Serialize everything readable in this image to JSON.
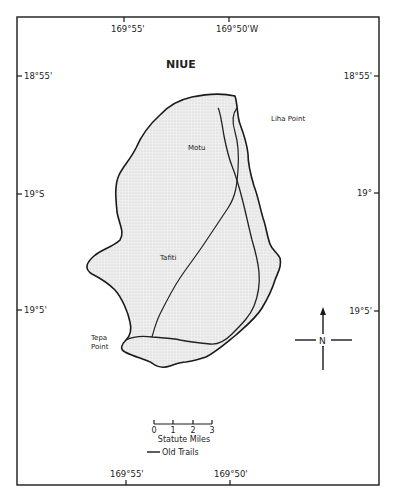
{
  "map": {
    "title": "NIUE",
    "longitude_labels_top": [
      "169°55'",
      "169°50'W"
    ],
    "longitude_labels_bottom": [
      "169°55'",
      "169°50'"
    ],
    "latitude_labels_left": [
      "18°55'",
      "19°S",
      "19°5'"
    ],
    "latitude_labels_right": [
      "18°55'",
      "19°",
      "19°5'"
    ],
    "places": [
      {
        "id": "liha-point",
        "label": "Liha Point"
      },
      {
        "id": "motu",
        "label": "Motu"
      },
      {
        "id": "tafiti",
        "label": "Tafiti"
      },
      {
        "id": "tepa-point",
        "label_line1": "Tepa",
        "label_line2": "Point"
      }
    ],
    "compass": {
      "label": "N",
      "icon": "north-arrow-icon"
    },
    "scale_bar": {
      "ticks": [
        "0",
        "1",
        "2",
        "3"
      ],
      "unit_label": "Statute Miles"
    },
    "legend": {
      "items": [
        {
          "label": "Old Trails",
          "symbol": "solid-line"
        }
      ]
    },
    "colors": {
      "frame": "#1a1a1a",
      "land_fill": "#e6e6e6",
      "coastline": "#1a1a1a",
      "trail": "#2a2a2a"
    }
  }
}
